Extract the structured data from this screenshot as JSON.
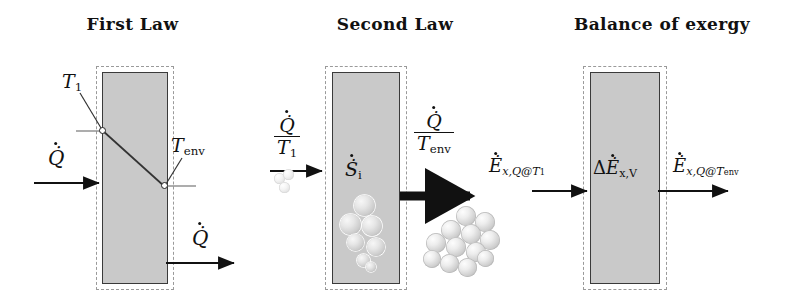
{
  "figure": {
    "type": "diagram",
    "panels": [
      {
        "id": "first-law",
        "title": "First Law",
        "labels": {
          "inlet_heat": "Q̇",
          "outlet_heat": "Q̇",
          "hot_surface_temp": "T",
          "hot_surface_temp_sub": "1",
          "cold_surface_temp": "T",
          "cold_surface_temp_sub": "env"
        },
        "nodes": [
          "T1-node",
          "Tenv-node"
        ],
        "profile": "linear temperature drop from T1 to Tenv across the wall"
      },
      {
        "id": "second-law",
        "title": "Second Law",
        "labels": {
          "inlet_entropy_num": "Q̇",
          "inlet_entropy_den": "T",
          "inlet_entropy_den_sub": "1",
          "outlet_entropy_num": "Q̇",
          "outlet_entropy_den": "T",
          "outlet_entropy_den_sub": "env",
          "generated_entropy": "Ṡ",
          "generated_entropy_sub": "i"
        },
        "spheres": {
          "inlet_count": 3,
          "inside_count": 7,
          "outlet_count": 12
        }
      },
      {
        "id": "balance-of-exergy",
        "title": "Balance of exergy",
        "labels": {
          "inlet_exergy": "Ė",
          "inlet_exergy_sub": "x,Q@T",
          "inlet_exergy_sub2": "1",
          "destroyed_exergy_delta": "Δ",
          "destroyed_exergy": "Ė",
          "destroyed_exergy_sub": "x,V",
          "outlet_exergy": "Ė",
          "outlet_exergy_sub": "x,Q@T",
          "outlet_exergy_sub2": "env"
        }
      }
    ],
    "colors": {
      "block_fill": "#c9c9c9",
      "block_stroke": "#3a3a3a",
      "boundary_dashed": "#9a9a9a",
      "arrow": "#111111",
      "background": "#ffffff"
    }
  }
}
